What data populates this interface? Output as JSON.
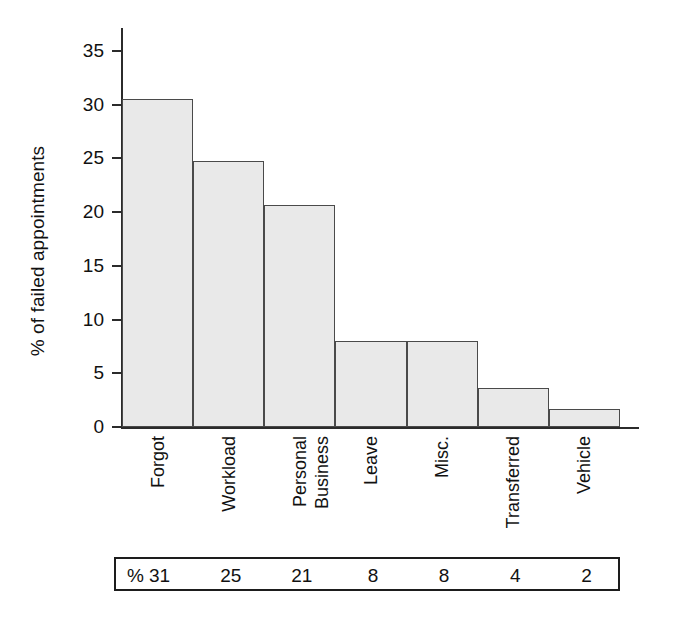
{
  "chart_data": {
    "type": "bar",
    "title": "",
    "xlabel": "",
    "ylabel": "% of failed appointments",
    "categories": [
      "Forgot",
      "Workload",
      "Personal Business",
      "Leave",
      "Misc.",
      "Transferred",
      "Vehicle"
    ],
    "category_lines": [
      [
        "Forgot"
      ],
      [
        "Workload"
      ],
      [
        "Personal",
        "Business"
      ],
      [
        "Leave"
      ],
      [
        "Misc."
      ],
      [
        "Transferred"
      ],
      [
        "Vehicle"
      ]
    ],
    "values": [
      30.5,
      24.8,
      20.7,
      8.0,
      8.0,
      3.6,
      1.7
    ],
    "ylim": [
      0,
      36
    ],
    "yticks": [
      0,
      5,
      10,
      15,
      20,
      25,
      30,
      35
    ],
    "ytick_labels": [
      "0",
      "5",
      "10",
      "15",
      "20",
      "25",
      "30",
      "35"
    ],
    "grid": false,
    "legend": false,
    "bar_fill_color": "#e9e9e9",
    "bar_edge_color": "#4a4a4a",
    "axis_color": "#2b2b2b"
  },
  "value_table": {
    "row_header": "%",
    "values": [
      "31",
      "25",
      "21",
      "8",
      "8",
      "4",
      "2"
    ]
  }
}
